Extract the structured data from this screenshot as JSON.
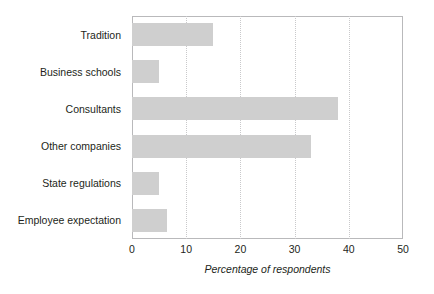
{
  "chart_data": {
    "type": "bar",
    "orientation": "horizontal",
    "title": "",
    "xlabel": "Percentage of respondents",
    "ylabel": "",
    "categories": [
      "Tradition",
      "Business schools",
      "Consultants",
      "Other companies",
      "State regulations",
      "Employee expectation"
    ],
    "values": [
      15,
      5,
      38,
      33,
      5,
      6.5
    ],
    "xlim": [
      0,
      50
    ],
    "xticks": [
      0,
      10,
      20,
      30,
      40,
      50
    ],
    "xtick_labels": [
      "0",
      "10",
      "20",
      "30",
      "40",
      "50"
    ],
    "grid": "vertical-dotted",
    "legend": "none",
    "bar_color": "#cfcfcf",
    "axis_color": "#b9b9bb",
    "gridline_color": "#c9c9cb",
    "text_color": "#231f20",
    "background": "#ffffff"
  }
}
